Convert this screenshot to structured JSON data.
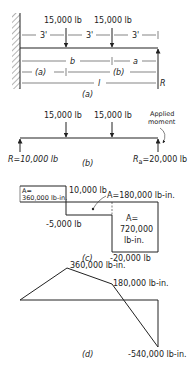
{
  "figure_a": {
    "loads": [
      "15,000 lb",
      "15,000 lb"
    ],
    "spans": [
      "3'",
      "3'",
      "3'"
    ],
    "dims": {
      "b": "b",
      "a": "a",
      "paren_a": "(a)",
      "paren_b": "(b)",
      "l": "l"
    },
    "reaction": "R",
    "caption": "(a)"
  },
  "figure_b": {
    "loads": [
      "15,000 lb",
      "15,000 lb"
    ],
    "applied_moment": [
      "Applied",
      "moment"
    ],
    "left_reaction": "R=10,000 lb",
    "right_reaction": "R",
    "right_reaction_sub": "a",
    "right_reaction_value": "=20,000 lb",
    "caption": "(b)"
  },
  "figure_c": {
    "area1": [
      "A=",
      "360,000 lb-in."
    ],
    "shear_top": "10,000 lb",
    "area2": "A=180,000 lb-in.",
    "shear_mid": "-5,000 lb",
    "area3": [
      "A=",
      "720,000",
      "lb-in."
    ],
    "shear_bottom": "-20,000 lb",
    "caption": "(c)"
  },
  "figure_d": {
    "peak": "360,000 lb-in.",
    "mid": "180,000 lb-in.",
    "end": "-540,000 lb-in.",
    "caption": "(d)"
  }
}
